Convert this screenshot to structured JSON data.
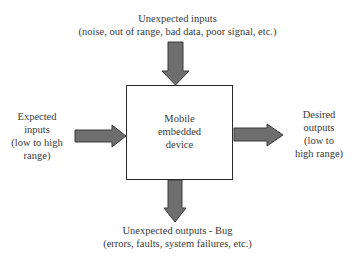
{
  "diagram": {
    "type": "block-diagram",
    "center": {
      "lines": [
        "Mobile",
        "embedded",
        "device"
      ]
    },
    "top_input": {
      "title": "Unexpected inputs",
      "detail": "(noise, out of range, bad data, poor signal, etc.)"
    },
    "left_input": {
      "lines": [
        "Expected",
        "inputs",
        "(low to high",
        "range)"
      ]
    },
    "right_output": {
      "lines": [
        "Desired",
        "outputs",
        "(low to",
        "high range)"
      ]
    },
    "bottom_output": {
      "title": "Unexpected outputs - Bug",
      "detail": "(errors, faults, system failures, etc.)"
    },
    "colors": {
      "arrow_fill": "#6e6e6e",
      "arrow_stroke": "#3a3a3a",
      "box_border": "#2a2a2a",
      "text": "#3a3a3a"
    }
  }
}
